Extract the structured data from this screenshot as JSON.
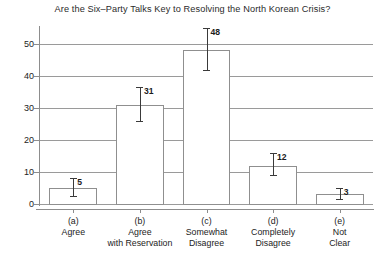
{
  "chart_data": {
    "type": "bar",
    "title": "Are the Six–Party Talks Key to Resolving the North Korean Crisis?",
    "xlabel": "",
    "ylabel": "",
    "ylim": [
      0,
      55
    ],
    "yticks": [
      0,
      10,
      20,
      30,
      40,
      50
    ],
    "ytick_labels": [
      "0",
      "10",
      "20",
      "30",
      "40",
      "50"
    ],
    "grid": true,
    "legend": false,
    "categories": [
      "(a)\nAgree",
      "(b)\nAgree\nwith Reservation",
      "(c)\nSomewhat\nDisagree",
      "(d)\nCompletely\nDisagree",
      "(e)\nNot\nClear"
    ],
    "category_lines": [
      [
        "(a)",
        "Agree"
      ],
      [
        "(b)",
        "Agree",
        "with Reservation"
      ],
      [
        "(c)",
        "Somewhat",
        "Disagree"
      ],
      [
        "(d)",
        "Completely",
        "Disagree"
      ],
      [
        "(e)",
        "Not",
        "Clear"
      ]
    ],
    "values": [
      5,
      31,
      48,
      12,
      3
    ],
    "value_labels": [
      "5",
      "31",
      "48",
      "12",
      "3"
    ],
    "error_low": [
      2.5,
      26,
      42,
      9,
      1.5
    ],
    "error_high": [
      8,
      36.5,
      55,
      16,
      5
    ]
  }
}
